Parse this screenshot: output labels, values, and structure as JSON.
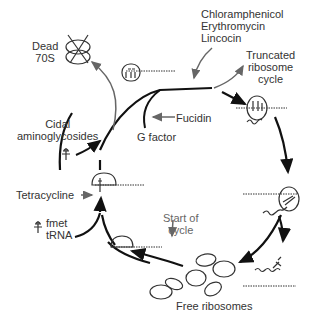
{
  "diagram": {
    "labels": {
      "dead_70s_line1": "Dead",
      "dead_70s_line2": "70S",
      "chloramphenicol": "Chloramphenicol",
      "erythromycin": "Erythromycin",
      "lincocin": "Lincocin",
      "truncated_line1": "Truncated",
      "truncated_line2": "ribosome",
      "truncated_line3": "cycle",
      "cidal_line1": "Cidal",
      "cidal_line2": "aminoglycosides",
      "fucidin": "Fucidin",
      "g_factor": "G factor",
      "tetracycline": "Tetracycline",
      "fmet_line1": "fmet",
      "fmet_line2": "tRNA",
      "start_line1": "Start of",
      "start_line2": "cycle",
      "free_ribosomes": "Free ribosomes"
    },
    "colors": {
      "line": "#111111",
      "inhibitor_arrow": "#666666",
      "text": "#333333"
    }
  }
}
